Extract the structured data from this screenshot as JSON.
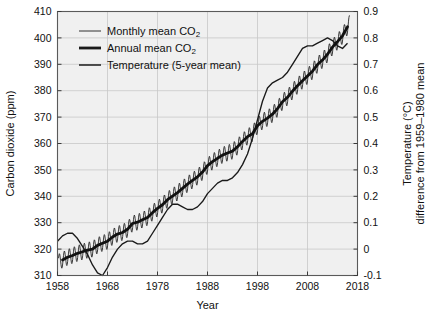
{
  "chart_data": {
    "type": "line",
    "title": "",
    "xlabel": "Year",
    "ylabel": "Carbon dioxide (ppm)",
    "y2label_line1": "Temperature (°C)",
    "y2label_line2": "difference from 1959–1980 mean",
    "xlim": [
      1958,
      2018
    ],
    "ylim": [
      310,
      410
    ],
    "y2lim": [
      -0.1,
      0.9
    ],
    "xticks": [
      1958,
      1968,
      1978,
      1988,
      1998,
      2008,
      2018
    ],
    "xtick_labels": [
      "1958",
      "1968",
      "1978",
      "1988",
      "1998",
      "2008",
      "2018"
    ],
    "yticks": [
      310,
      320,
      330,
      340,
      350,
      360,
      370,
      380,
      390,
      400,
      410
    ],
    "ytick_labels": [
      "310",
      "320",
      "330",
      "340",
      "350",
      "360",
      "370",
      "380",
      "390",
      "400",
      "410"
    ],
    "y2ticks": [
      -0.1,
      0,
      0.1,
      0.2,
      0.3,
      0.4,
      0.5,
      0.6,
      0.7,
      0.8,
      0.9
    ],
    "y2tick_labels": [
      "-0.1",
      "0",
      "0.1",
      "0.2",
      "0.3",
      "0.4",
      "0.5",
      "0.6",
      "0.7",
      "0.8",
      "0.9"
    ],
    "grid": true,
    "legend_position": "top-left",
    "legend": [
      {
        "label": "Monthly mean CO",
        "sub": "2",
        "style": "thin",
        "color": "#1a1a1a"
      },
      {
        "label": "Annual mean CO",
        "sub": "2",
        "style": "thick",
        "color": "#1a1a1a"
      },
      {
        "label": "Temperature (5-year mean)",
        "sub": "",
        "style": "medium",
        "color": "#1a1a1a"
      }
    ],
    "series": [
      {
        "name": "Annual mean CO2",
        "axis": "left",
        "units": "ppm",
        "x": [
          1959,
          1960,
          1961,
          1962,
          1963,
          1964,
          1965,
          1966,
          1967,
          1968,
          1969,
          1970,
          1971,
          1972,
          1973,
          1974,
          1975,
          1976,
          1977,
          1978,
          1979,
          1980,
          1981,
          1982,
          1983,
          1984,
          1985,
          1986,
          1987,
          1988,
          1989,
          1990,
          1991,
          1992,
          1993,
          1994,
          1995,
          1996,
          1997,
          1998,
          1999,
          2000,
          2001,
          2002,
          2003,
          2004,
          2005,
          2006,
          2007,
          2008,
          2009,
          2010,
          2011,
          2012,
          2013,
          2014,
          2015,
          2016
        ],
        "values": [
          315.9,
          316.9,
          317.6,
          318.4,
          319.0,
          319.6,
          320.0,
          321.4,
          322.2,
          323.0,
          324.6,
          325.7,
          326.3,
          327.5,
          329.7,
          330.2,
          331.1,
          332.0,
          333.8,
          335.4,
          336.8,
          338.7,
          340.1,
          341.4,
          343.0,
          344.6,
          346.0,
          347.4,
          349.2,
          351.6,
          353.1,
          354.4,
          355.6,
          356.4,
          357.1,
          358.8,
          360.8,
          362.6,
          363.7,
          366.7,
          368.4,
          369.6,
          371.1,
          373.2,
          375.8,
          377.5,
          379.8,
          381.9,
          383.8,
          385.6,
          387.4,
          389.9,
          391.6,
          393.8,
          396.5,
          398.6,
          400.8,
          404.2
        ]
      },
      {
        "name": "Monthly mean CO2",
        "axis": "left",
        "units": "ppm",
        "description": "Seasonal sawtooth oscillation about the annual mean, amplitude about 3 ppm peak in May and trough in October",
        "seasonal_amplitude_ppm": 3.0,
        "peak_month": 5,
        "trough_month": 10,
        "x_start": 1958.2,
        "x_end": 2016.5
      },
      {
        "name": "Temperature (5-year mean)",
        "axis": "right",
        "units": "°C",
        "x": [
          1958,
          1959,
          1960,
          1961,
          1962,
          1963,
          1964,
          1965,
          1966,
          1967,
          1968,
          1969,
          1970,
          1971,
          1972,
          1973,
          1974,
          1975,
          1976,
          1977,
          1978,
          1979,
          1980,
          1981,
          1982,
          1983,
          1984,
          1985,
          1986,
          1987,
          1988,
          1989,
          1990,
          1991,
          1992,
          1993,
          1994,
          1995,
          1996,
          1997,
          1998,
          1999,
          2000,
          2001,
          2002,
          2003,
          2004,
          2005,
          2006,
          2007,
          2008,
          2009,
          2010,
          2011,
          2012,
          2013,
          2014,
          2015,
          2016
        ],
        "values": [
          0.03,
          0.05,
          0.06,
          0.06,
          0.04,
          0.01,
          -0.02,
          -0.06,
          -0.09,
          -0.1,
          -0.07,
          -0.03,
          0.0,
          0.02,
          0.03,
          0.03,
          0.02,
          0.02,
          0.03,
          0.06,
          0.09,
          0.12,
          0.15,
          0.17,
          0.17,
          0.16,
          0.15,
          0.15,
          0.16,
          0.18,
          0.21,
          0.23,
          0.25,
          0.26,
          0.26,
          0.27,
          0.29,
          0.32,
          0.36,
          0.42,
          0.49,
          0.56,
          0.61,
          0.63,
          0.64,
          0.65,
          0.67,
          0.7,
          0.73,
          0.76,
          0.77,
          0.77,
          0.78,
          0.79,
          0.8,
          0.79,
          0.77,
          0.76,
          0.78
        ]
      }
    ]
  }
}
